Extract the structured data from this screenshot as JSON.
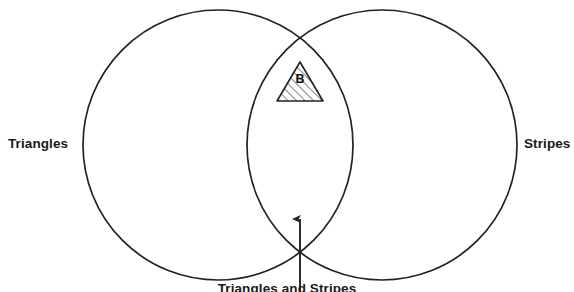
{
  "diagram": {
    "type": "venn",
    "title": "",
    "background_color": "#ffffff",
    "stroke_color": "#222222",
    "sets": [
      {
        "id": "left",
        "label": "Triangles",
        "center_x": 218,
        "center_y": 145,
        "radius": 135
      },
      {
        "id": "right",
        "label": "Stripes",
        "center_x": 382,
        "center_y": 145,
        "radius": 135
      }
    ],
    "intersection": {
      "label": "Triangles and Stripes",
      "pointer_target_x": 300,
      "pointer_target_y": 240
    },
    "shapes": [
      {
        "id": "hatched-triangle",
        "shape": "triangle",
        "fill": "hatch-diagonal",
        "letter": "B",
        "apex_x": 300,
        "apex_y": 62,
        "base_left_x": 277,
        "base_right_x": 323,
        "base_y": 101
      }
    ]
  }
}
